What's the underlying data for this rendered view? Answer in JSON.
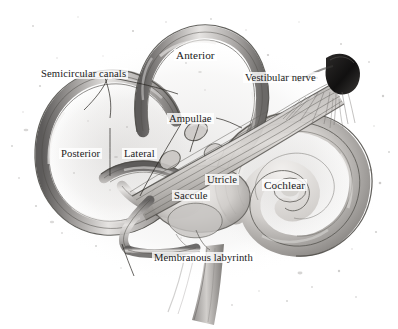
{
  "figure": {
    "style": "graphite pencil anatomical illustration, grayscale",
    "background_color": "#ffffff",
    "ink_color": "#1a1a1a",
    "width": 398,
    "height": 329
  },
  "labels": [
    {
      "id": "semicircular-canals",
      "text": "Semicircular canals",
      "x": 39,
      "y": 68,
      "size": "sz-md"
    },
    {
      "id": "anterior",
      "text": "Anterior",
      "x": 174,
      "y": 49,
      "size": "sz-lg"
    },
    {
      "id": "vestibular-nerve",
      "text": "Vestibular nerve",
      "x": 243,
      "y": 72,
      "size": "sz-md"
    },
    {
      "id": "ampullae",
      "text": "Ampullae",
      "x": 167,
      "y": 113,
      "size": "sz-md"
    },
    {
      "id": "posterior",
      "text": "Posterior",
      "x": 59,
      "y": 148,
      "size": "sz-md"
    },
    {
      "id": "lateral",
      "text": "Lateral",
      "x": 122,
      "y": 148,
      "size": "sz-md"
    },
    {
      "id": "utricle",
      "text": "Utricle",
      "x": 205,
      "y": 174,
      "size": "sz-md"
    },
    {
      "id": "cochlear",
      "text": "Cochlear",
      "x": 262,
      "y": 179,
      "size": "sz-lg"
    },
    {
      "id": "saccule",
      "text": "Saccule",
      "x": 172,
      "y": 190,
      "size": "sz-md"
    },
    {
      "id": "membranous-labyrinth",
      "text": "Membranous labyrinth",
      "x": 152,
      "y": 252,
      "size": "sz-md"
    }
  ],
  "structures": [
    {
      "id": "anterior-semicircular-canal",
      "name": "Anterior semicircular canal"
    },
    {
      "id": "posterior-semicircular-canal",
      "name": "Posterior semicircular canal"
    },
    {
      "id": "lateral-semicircular-canal",
      "name": "Lateral semicircular canal"
    },
    {
      "id": "ampullae-swellings",
      "name": "Ampullae"
    },
    {
      "id": "utricle-sac",
      "name": "Utricle"
    },
    {
      "id": "saccule-sac",
      "name": "Saccule"
    },
    {
      "id": "cochlear-duct-spiral",
      "name": "Cochlear duct"
    },
    {
      "id": "vestibular-nerve-trunk",
      "name": "Vestibular nerve"
    },
    {
      "id": "nerve-fiber-fan",
      "name": "Nerve fiber fan"
    },
    {
      "id": "cut-nerve-end",
      "name": "Cut nerve end"
    },
    {
      "id": "descending-duct",
      "name": "Descending duct"
    },
    {
      "id": "stipple-texture",
      "name": "Stipple texture"
    }
  ],
  "leaders": [
    {
      "id": "leader-semicircular-to-posterior",
      "from": "semicircular-canals",
      "to": "posterior-semicircular-canal"
    },
    {
      "id": "leader-semicircular-to-anterior",
      "from": "semicircular-canals",
      "to": "anterior-semicircular-canal"
    },
    {
      "id": "leader-lateral-to-canal",
      "from": "lateral",
      "to": "lateral-semicircular-canal"
    },
    {
      "id": "leader-ampullae-left",
      "from": "ampullae",
      "to": "ampullae-swellings"
    },
    {
      "id": "leader-ampullae-right",
      "from": "ampullae",
      "to": "ampullae-swellings"
    },
    {
      "id": "leader-vestibular-nerve",
      "from": "vestibular-nerve",
      "to": "cut-nerve-end"
    }
  ]
}
